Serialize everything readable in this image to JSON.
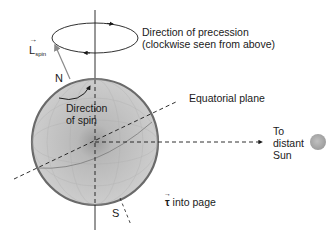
{
  "diagram": {
    "labels": {
      "precession_line1": "Direction of precession",
      "precession_line2": "(clockwise seen from above)",
      "l_spin_symbol": "L",
      "l_spin_subscript": "spin",
      "north": "N",
      "south": "S",
      "spin_line1": "Direction",
      "spin_line2": "of spin",
      "equatorial_plane": "Equatorial plane",
      "sun_line1": "To",
      "sun_line2": "distant",
      "sun_line3": "Sun",
      "torque_symbol": "τ",
      "torque_text": " into page"
    },
    "colors": {
      "earth_fill": "#c4c4c4",
      "earth_rim": "#6a6a6a",
      "spin_axis": "#8a8a8a",
      "sun": "#a8a8a8",
      "line": "#1a1a1a"
    }
  }
}
